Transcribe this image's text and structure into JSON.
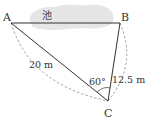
{
  "diagram": {
    "type": "geometry-triangle",
    "points": {
      "A": {
        "label": "A",
        "x": 11,
        "y": 23
      },
      "B": {
        "label": "B",
        "x": 120,
        "y": 23
      },
      "C": {
        "label": "C",
        "x": 108,
        "y": 101
      }
    },
    "pond_label": "池",
    "measurements": {
      "AC": "20 m",
      "BC": "12.5 m",
      "angle_C": "60°"
    },
    "colors": {
      "line": "#333333",
      "dashed": "#8a8a8a",
      "pond": "#e6e6e6",
      "text": "#333333"
    }
  }
}
